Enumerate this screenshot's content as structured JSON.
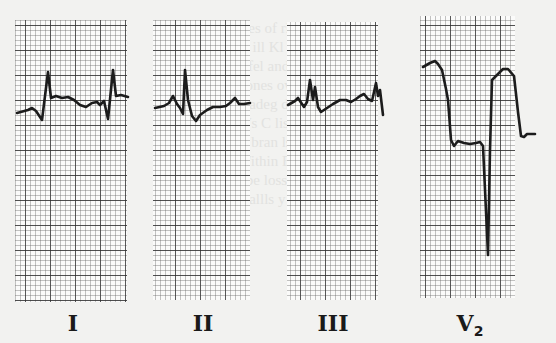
{
  "figure": {
    "leads": [
      {
        "id": "I",
        "label": "I",
        "x": 15,
        "y": 20,
        "w": 112,
        "h": 282
      },
      {
        "id": "II",
        "label": "II",
        "x": 153,
        "y": 20,
        "w": 97,
        "h": 280
      },
      {
        "id": "III",
        "label": "III",
        "x": 287,
        "y": 22,
        "w": 91,
        "h": 278
      },
      {
        "id": "V2",
        "label": "V",
        "subscript": "2",
        "x": 420,
        "y": 16,
        "w": 95,
        "h": 282
      }
    ],
    "grid": {
      "minor_px": 5,
      "major_every": 5,
      "minor_color": "#6a6a6a",
      "major_color": "#2a2a2a",
      "paper_color": "#fbfbfa"
    },
    "trace_color": "#1c1c1c",
    "traces": {
      "I": "M17,113 L28,110 L32,108 L36,111 L42,120 L48,72 L51,98 L56,96 L62,98 L68,97 L74,100 L80,105 L86,107 L92,103 L97,102 L100,105 L104,101 L108,119 L113,70 L116,96 L121,95 L128,97",
      "II": "M155,108 L164,106 L169,103 L173,96 L177,104 L180,108 L183,114 L185,70 L188,100 L192,116 L196,121 L200,115 L207,110 L213,107 L220,107 L226,106 L230,103 L235,98 L239,104 L244,104 L250,103",
      "III": "M288,105 L295,101 L298,98 L304,107 L307,102 L310,80 L313,100 L315,87 L318,107 L321,112 L327,108 L333,104 L340,100 L346,100 L351,102 L356,99 L360,96 L364,94 L368,99 L372,101 L376,83 L378,96 L380,90 L383,115",
      "V2": "M423,67 L430,63 L435,61 L438,64 L442,70 L446,89 L448,100 L451,140 L454,146 L458,141 L464,143 L470,144 L476,143 L480,142 L483,146 L488,255 L490,150 L492,80 L495,77 L503,69 L508,69 L514,76 L518,112 L521,136 L524,137 L527,134 L532,134 L535,134"
    }
  },
  "background_text": {
    "lines": [
      "",
      "adies of rlisenses",
      "  b, ill Kl or wmmand",
      "  e fel and of tel lan",
      "  l ones ow ounce s",
      "  loadeg da ety s",
      "  Ws C lis Cm",
      "  ts bran ls fl ul fu",
      "  Within Bell ies am t",
      "  Pbe loss ae so cin ed",
      "  arallls y rl"
    ]
  }
}
